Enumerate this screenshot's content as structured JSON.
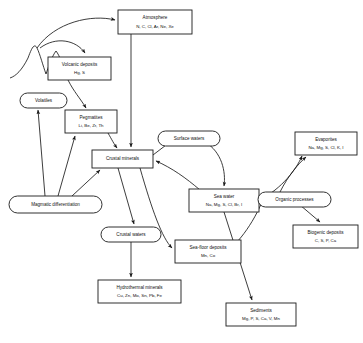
{
  "diagram": {
    "type": "flow-diagram",
    "background_color": "#ffffff",
    "line_color": "#1a1a1a",
    "nodes": [
      {
        "id": "atmosphere",
        "shape": "rect",
        "label": "Atmosphere",
        "sub": "N, C, Cl, Ar, Ne, Xe",
        "x": 118,
        "y": 10,
        "w": 74,
        "h": 24
      },
      {
        "id": "volcanic-deposits",
        "shape": "rect",
        "label": "Volcanic deposits",
        "sub": "Hg, S",
        "x": 48,
        "y": 57,
        "w": 63,
        "h": 23
      },
      {
        "id": "volatiles",
        "shape": "ellipse",
        "label": "Volatiles",
        "sub": "",
        "x": 20,
        "y": 93,
        "w": 47,
        "h": 15
      },
      {
        "id": "pegmatites",
        "shape": "rect",
        "label": "Pegmatites",
        "sub": "Li, Be, Zr, Th",
        "x": 65,
        "y": 110,
        "w": 52,
        "h": 23
      },
      {
        "id": "crustal-minerals",
        "shape": "rect",
        "label": "Crustal minerals",
        "sub": "",
        "x": 92,
        "y": 150,
        "w": 61,
        "h": 18
      },
      {
        "id": "surface-waters",
        "shape": "ellipse",
        "label": "Surface waters",
        "sub": "",
        "x": 158,
        "y": 131,
        "w": 62,
        "h": 15
      },
      {
        "id": "evaporites",
        "shape": "rect",
        "label": "Evaporites",
        "sub": "Na, Mg, S, Cl, K, I",
        "x": 295,
        "y": 132,
        "w": 62,
        "h": 23
      },
      {
        "id": "sea-water",
        "shape": "rect",
        "label": "Sea water",
        "sub": "Na, Mg, S, Cl, Br, I",
        "x": 189,
        "y": 189,
        "w": 70,
        "h": 23
      },
      {
        "id": "organic-processes",
        "shape": "ellipse",
        "label": "Organic processes",
        "sub": "",
        "x": 258,
        "y": 192,
        "w": 73,
        "h": 15
      },
      {
        "id": "biogenic-deposits",
        "shape": "rect",
        "label": "Biogenic deposits",
        "sub": "C, S, P, Ca",
        "x": 293,
        "y": 225,
        "w": 65,
        "h": 23
      },
      {
        "id": "magmatic-differentiation",
        "shape": "ellipse",
        "label": "Magmatic differentiation",
        "sub": "",
        "x": 9,
        "y": 196,
        "w": 93,
        "h": 17
      },
      {
        "id": "crustal-waters",
        "shape": "ellipse",
        "label": "Crustal waters",
        "sub": "",
        "x": 101,
        "y": 227,
        "w": 60,
        "h": 15
      },
      {
        "id": "sea-floor-deposits",
        "shape": "rect",
        "label": "Sea-floor deposits",
        "sub": "Mn, Co",
        "x": 175,
        "y": 240,
        "w": 66,
        "h": 23
      },
      {
        "id": "hydrothermal-minerals",
        "shape": "rect",
        "label": "Hydrothermal minerals",
        "sub": "Cu, Zn, Mo, Sn, Pb, Fe",
        "x": 98,
        "y": 280,
        "w": 83,
        "h": 23
      },
      {
        "id": "sediments",
        "shape": "rect",
        "label": "Sediments",
        "sub": "Mg, P, S, Ca, V, Mn",
        "x": 226,
        "y": 303,
        "w": 70,
        "h": 23
      }
    ],
    "edges": [
      {
        "id": "volcano-to-atmosphere",
        "from": "volcano-peak",
        "to": "atmosphere",
        "path": "M 37 48 C 55 22 92 14 115 20"
      },
      {
        "id": "volcano-to-volcanic-deposits",
        "from": "volcano-peak",
        "to": "volcanic-deposits",
        "path": "M 40 48 C 56 36 76 40 85 53"
      },
      {
        "id": "atmosphere-to-crustal-minerals",
        "from": "atmosphere",
        "to": "crustal-minerals",
        "path": "M 131 34 L 131 147"
      },
      {
        "id": "volcanic-deposits-to-pegmatites",
        "from": "volcanic-deposits",
        "to": "pegmatites",
        "path": "M 68 80 C 74 92 80 98 86 108"
      },
      {
        "id": "pegmatites-to-crustal-minerals",
        "from": "pegmatites",
        "to": "crustal-minerals",
        "path": "M 108 133 C 112 140 114 144 117 148"
      },
      {
        "id": "magmatic-to-volatiles",
        "from": "magmatic-differentiation",
        "to": "volatiles",
        "path": "M 45 196 L 38 110"
      },
      {
        "id": "magmatic-to-pegmatites",
        "from": "magmatic-differentiation",
        "to": "pegmatites",
        "path": "M 58 196 L 75 136"
      },
      {
        "id": "magmatic-to-crustal-minerals",
        "from": "magmatic-differentiation",
        "to": "crustal-minerals",
        "path": "M 72 196 L 100 170"
      },
      {
        "id": "crustal-minerals-to-surface-waters",
        "from": "crustal-minerals",
        "to": "surface-waters",
        "path": "M 153 155 L 170 142"
      },
      {
        "id": "surface-waters-to-sea-water",
        "from": "surface-waters",
        "to": "sea-water",
        "path": "M 205 142 C 222 152 226 172 224 186"
      },
      {
        "id": "sea-water-to-crustal-minerals",
        "from": "sea-water",
        "to": "crustal-minerals",
        "path": "M 200 190 C 186 178 172 168 156 161"
      },
      {
        "id": "crustal-minerals-to-crustal-waters",
        "from": "crustal-minerals",
        "to": "crustal-waters",
        "path": "M 118 168 L 134 224"
      },
      {
        "id": "crustal-waters-to-hydrothermal",
        "from": "crustal-waters",
        "to": "hydrothermal-minerals",
        "path": "M 131 242 L 131 277"
      },
      {
        "id": "crustal-minerals-to-sea-floor-deposits",
        "from": "crustal-minerals",
        "to": "sea-floor-deposits",
        "path": "M 140 168 C 152 210 162 238 172 248"
      },
      {
        "id": "sea-water-to-sediments",
        "from": "sea-water",
        "to": "sediments",
        "path": "M 224 212 L 252 300"
      },
      {
        "id": "sea-water-to-evaporites",
        "from": "sea-water",
        "to": "evaporites",
        "path": "M 260 200 C 282 188 296 170 302 156"
      },
      {
        "id": "organic-processes-to-evaporites",
        "from": "organic-processes",
        "to": "evaporites",
        "path": "M 280 192 C 288 176 298 164 306 157"
      },
      {
        "id": "organic-processes-to-biogenic-deposits",
        "from": "organic-processes",
        "to": "biogenic-deposits",
        "path": "M 300 205 L 320 222"
      },
      {
        "id": "organic-processes-to-sea-floor",
        "from": "organic-processes",
        "to": "sea-floor-deposits",
        "path": "M 262 202 C 250 230 232 250 222 254"
      }
    ],
    "terrain": {
      "id": "volcano-profile",
      "label": "volcano-terrain-profile",
      "path": "M 10 78 C 16 76 22 70 28 58 C 31 50 34 42 37 48 C 40 54 43 66 46 74 C 48 68 52 56 56 51 C 60 56 62 64 64 72"
    }
  }
}
